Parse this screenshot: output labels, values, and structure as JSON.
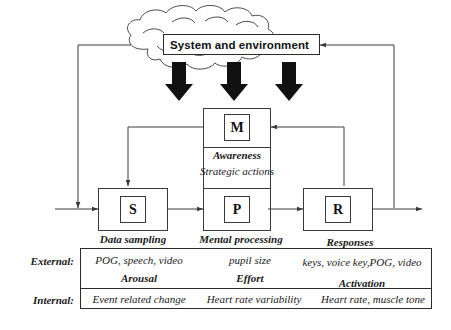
{
  "diagram": {
    "title": "System and environment",
    "cloud_label": "System and environment",
    "nodes": {
      "s": "S",
      "p": "P",
      "r": "R",
      "m": "M"
    },
    "middle_labels": {
      "awareness": "Awareness",
      "strategic_actions": "Strategic actions"
    },
    "captions": {
      "sampling": "Data sampling",
      "processing": "Mental processing",
      "responses": "Responses"
    },
    "colors": {
      "line": "#3a3a3a",
      "arrow_fill": "#111111",
      "background": "#ffffff",
      "text": "#1a1a1a"
    }
  },
  "table": {
    "rows": [
      {
        "label": "External:",
        "cells": [
          "POG, speech, video",
          "pupil size",
          "keys, voice key,POG, video"
        ],
        "subcaptions": [
          "Arousal",
          "Effort",
          "Activation"
        ]
      },
      {
        "label": "Internal:",
        "cells": [
          "Event related change",
          "Heart rate variability",
          "Heart rate, muscle tone"
        ],
        "subcaptions": []
      }
    ]
  }
}
